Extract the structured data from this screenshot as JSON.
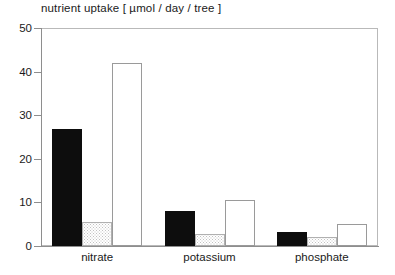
{
  "chart_data": {
    "type": "bar",
    "title": "nutrient uptake [ µmol / day / tree ]",
    "xlabel": "",
    "ylabel": "",
    "ylim": [
      0,
      50
    ],
    "yticks": [
      0,
      10,
      20,
      30,
      40,
      50
    ],
    "ytick_labels": [
      "0",
      "10",
      "20",
      "30",
      "40",
      "50"
    ],
    "grid": false,
    "legend": "none",
    "categories": [
      "nitrate",
      "potassium",
      "phosphate"
    ],
    "series": [
      {
        "name": "black",
        "fill": "solid-black",
        "values": [
          26.8,
          8.1,
          3.1
        ]
      },
      {
        "name": "stippled",
        "fill": "dotted-gray",
        "values": [
          5.4,
          2.7,
          2.1
        ]
      },
      {
        "name": "open",
        "fill": "white-outline",
        "values": [
          42.0,
          10.5,
          5.0
        ]
      }
    ]
  },
  "colors": {
    "solid_bar": "#0d0d0d",
    "open_bar_border": "#9a9a9a",
    "dotted_bar_border": "#b0b0b0",
    "dotted_bar_pattern": "#c2c2c2",
    "axis": "#8e8e8e",
    "frame": "#b9b9b9",
    "text": "#1a1a1a",
    "background": "#ffffff"
  }
}
